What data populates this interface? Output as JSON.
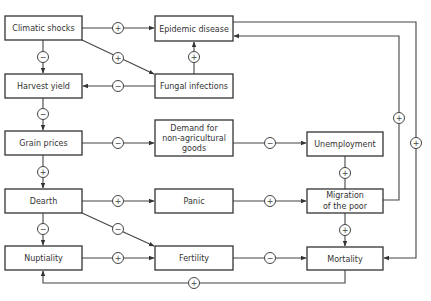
{
  "nodes": {
    "climatic_shocks": "Climatic shocks",
    "epidemic_disease": "Epidemic disease",
    "fungal_infections": "Fungal infections",
    "harvest_yield": "Harvest yield",
    "grain_prices": "Grain prices",
    "demand_line1": "Demand for",
    "demand_line2": "non-agricultural",
    "demand_line3": "goods",
    "unemployment": "Unemployment",
    "dearth": "Dearth",
    "panic": "Panic",
    "migration_line1": "Migration",
    "migration_line2": "of the poor",
    "nuptiality": "Nuptiality",
    "fertility": "Fertility",
    "mortality": "Mortality"
  },
  "edges": [
    {
      "from": "Climatic shocks",
      "to": "Epidemic disease",
      "sign": "+"
    },
    {
      "from": "Climatic shocks",
      "to": "Fungal infections",
      "sign": "+"
    },
    {
      "from": "Climatic shocks",
      "to": "Harvest yield",
      "sign": "−"
    },
    {
      "from": "Fungal infections",
      "to": "Epidemic disease",
      "sign": "+"
    },
    {
      "from": "Fungal infections",
      "to": "Harvest yield",
      "sign": "−"
    },
    {
      "from": "Harvest yield",
      "to": "Grain prices",
      "sign": "−"
    },
    {
      "from": "Grain prices",
      "to": "Demand for non-agricultural goods",
      "sign": "−"
    },
    {
      "from": "Grain prices",
      "to": "Dearth",
      "sign": "+"
    },
    {
      "from": "Demand for non-agricultural goods",
      "to": "Unemployment",
      "sign": "−"
    },
    {
      "from": "Unemployment",
      "to": "Migration of the poor",
      "sign": "+"
    },
    {
      "from": "Dearth",
      "to": "Panic",
      "sign": "+"
    },
    {
      "from": "Dearth",
      "to": "Fertility",
      "sign": "−"
    },
    {
      "from": "Dearth",
      "to": "Nuptiality",
      "sign": "−"
    },
    {
      "from": "Panic",
      "to": "Migration of the poor",
      "sign": "+"
    },
    {
      "from": "Migration of the poor",
      "to": "Mortality",
      "sign": "+"
    },
    {
      "from": "Migration of the poor",
      "to": "Epidemic disease",
      "sign": "+"
    },
    {
      "from": "Epidemic disease",
      "to": "Mortality",
      "sign": "+"
    },
    {
      "from": "Nuptiality",
      "to": "Fertility",
      "sign": "+"
    },
    {
      "from": "Fertility",
      "to": "Mortality",
      "sign": "−"
    },
    {
      "from": "Mortality",
      "to": "Nuptiality",
      "sign": "+"
    }
  ],
  "signs": {
    "plus": "+",
    "minus": "−"
  }
}
